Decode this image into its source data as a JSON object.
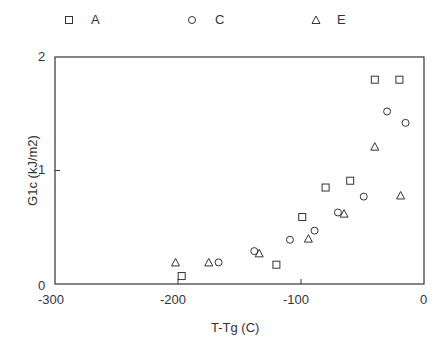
{
  "chart_data": {
    "type": "scatter",
    "title": "",
    "xlabel": "T-Tg (C)",
    "ylabel": "G1c (kJ/m2)",
    "xlim": [
      -300,
      0
    ],
    "ylim": [
      0,
      2
    ],
    "xticks": [
      "-300",
      "-200",
      "-100",
      "0"
    ],
    "yticks": [
      "0",
      "1",
      "2"
    ],
    "grid": false,
    "legend_position": "top",
    "series": [
      {
        "name": "A",
        "marker": "square",
        "x": [
          -197,
          -120,
          -99,
          -80,
          -60,
          -40,
          -20
        ],
        "y": [
          0.07,
          0.17,
          0.59,
          0.85,
          0.91,
          1.8,
          1.8
        ]
      },
      {
        "name": "C",
        "marker": "circle",
        "x": [
          -167,
          -138,
          -109,
          -89,
          -70,
          -49,
          -30,
          -15
        ],
        "y": [
          0.19,
          0.29,
          0.39,
          0.47,
          0.63,
          0.77,
          1.52,
          1.42
        ]
      },
      {
        "name": "E",
        "marker": "triangle",
        "x": [
          -202,
          -175,
          -134,
          -94,
          -65,
          -40,
          -19
        ],
        "y": [
          0.19,
          0.19,
          0.27,
          0.4,
          0.62,
          1.21,
          0.78
        ]
      }
    ]
  },
  "legend": {
    "items": [
      {
        "label": "A"
      },
      {
        "label": "C"
      },
      {
        "label": "E"
      }
    ]
  },
  "colors": {
    "axis": "#333333",
    "marker": "#333333"
  }
}
